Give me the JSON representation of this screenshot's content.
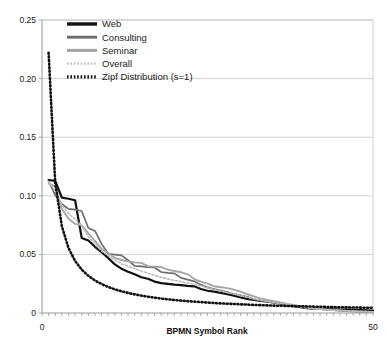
{
  "chart_data": {
    "type": "line",
    "title": "",
    "xlabel": "BPMN Symbol Rank",
    "ylabel": "",
    "xlim": [
      0,
      50
    ],
    "ylim": [
      0,
      0.25
    ],
    "grid": true,
    "legend_position": "top-left-inside",
    "x_tick_labels": [
      "0",
      "50"
    ],
    "x_tick_values": [
      0,
      50
    ],
    "x_minor_tick_count": 50,
    "y_tick_labels": [
      "0",
      "0.05",
      "0.10",
      "0.15",
      "0.20",
      "0.25"
    ],
    "y_tick_values": [
      0,
      0.05,
      0.1,
      0.15,
      0.2,
      0.25
    ],
    "x": [
      1,
      2,
      3,
      4,
      5,
      6,
      7,
      8,
      9,
      10,
      11,
      12,
      13,
      14,
      15,
      16,
      17,
      18,
      19,
      20,
      21,
      22,
      23,
      24,
      25,
      26,
      27,
      28,
      29,
      30,
      31,
      32,
      33,
      34,
      35,
      36,
      37,
      38,
      39,
      40,
      41,
      42,
      43,
      44,
      45,
      46,
      47,
      48,
      49,
      50
    ],
    "series": [
      {
        "name": "Web",
        "color": "#111111",
        "width": 2.2,
        "dash": "none",
        "values": [
          0.1135,
          0.1128,
          0.0985,
          0.0975,
          0.0962,
          0.064,
          0.0618,
          0.0565,
          0.052,
          0.047,
          0.0415,
          0.0378,
          0.0352,
          0.033,
          0.0305,
          0.0292,
          0.0268,
          0.0255,
          0.0248,
          0.0242,
          0.0238,
          0.0232,
          0.0228,
          0.0205,
          0.019,
          0.0182,
          0.0172,
          0.016,
          0.0148,
          0.0132,
          0.012,
          0.0112,
          0.0104,
          0.0098,
          0.009,
          0.0082,
          0.007,
          0.006,
          0.005,
          0.0042,
          0.0038,
          0.0036,
          0.0034,
          0.0032,
          0.003,
          0.0028,
          0.0026,
          0.0024,
          0.0022,
          0.002
        ]
      },
      {
        "name": "Consulting",
        "color": "#6e6e6e",
        "width": 1.7,
        "dash": "none",
        "values": [
          0.1125,
          0.1005,
          0.093,
          0.0888,
          0.0882,
          0.087,
          0.0725,
          0.07,
          0.059,
          0.0505,
          0.0498,
          0.0492,
          0.045,
          0.0402,
          0.0398,
          0.0392,
          0.0388,
          0.035,
          0.0342,
          0.0338,
          0.03,
          0.0285,
          0.027,
          0.0242,
          0.0218,
          0.0205,
          0.0192,
          0.0178,
          0.0162,
          0.015,
          0.0138,
          0.0118,
          0.0105,
          0.0095,
          0.0088,
          0.008,
          0.0072,
          0.0062,
          0.0052,
          0.0045,
          0.0038,
          0.0032,
          0.0028,
          0.0024,
          0.002,
          0.0016,
          0.0013,
          0.0011,
          0.001,
          0.0008
        ]
      },
      {
        "name": "Seminar",
        "color": "#a6a6a6",
        "width": 1.9,
        "dash": "none",
        "values": [
          0.1105,
          0.108,
          0.089,
          0.0805,
          0.076,
          0.0748,
          0.068,
          0.0615,
          0.0548,
          0.0512,
          0.047,
          0.0452,
          0.044,
          0.0432,
          0.0428,
          0.04,
          0.0396,
          0.0392,
          0.037,
          0.0358,
          0.0348,
          0.033,
          0.029,
          0.0268,
          0.025,
          0.0228,
          0.022,
          0.0212,
          0.02,
          0.0182,
          0.016,
          0.0142,
          0.0125,
          0.0112,
          0.01,
          0.009,
          0.0078,
          0.0068,
          0.0058,
          0.0048,
          0.004,
          0.0034,
          0.003,
          0.0026,
          0.0022,
          0.0018,
          0.0015,
          0.0013,
          0.0011,
          0.0009
        ]
      },
      {
        "name": "Overall",
        "color": "#bdbdbd",
        "width": 1.6,
        "dash": "2,2",
        "values": [
          0.112,
          0.1042,
          0.092,
          0.085,
          0.08,
          0.0745,
          0.065,
          0.0588,
          0.053,
          0.049,
          0.0452,
          0.042,
          0.0398,
          0.0378,
          0.0358,
          0.034,
          0.0322,
          0.0305,
          0.029,
          0.0278,
          0.0268,
          0.0255,
          0.0245,
          0.0232,
          0.0215,
          0.02,
          0.0188,
          0.0175,
          0.0162,
          0.0148,
          0.0135,
          0.0122,
          0.011,
          0.01,
          0.009,
          0.0082,
          0.0072,
          0.0062,
          0.0053,
          0.0045,
          0.0038,
          0.0033,
          0.0029,
          0.0025,
          0.0022,
          0.0019,
          0.0016,
          0.0014,
          0.0012,
          0.001
        ]
      },
      {
        "name": "Zipf Distribution (s=1)",
        "color": "#111111",
        "width": 2.6,
        "dash": "1,2.6",
        "values": [
          0.222,
          0.111,
          0.074,
          0.0555,
          0.0444,
          0.037,
          0.0317,
          0.0278,
          0.0247,
          0.0222,
          0.0202,
          0.0185,
          0.0171,
          0.0159,
          0.0148,
          0.0139,
          0.0131,
          0.0123,
          0.0117,
          0.0111,
          0.0106,
          0.0101,
          0.0097,
          0.0093,
          0.0089,
          0.0085,
          0.0082,
          0.0079,
          0.0077,
          0.0074,
          0.0072,
          0.0069,
          0.0067,
          0.0065,
          0.0063,
          0.0062,
          0.006,
          0.0058,
          0.0057,
          0.0056,
          0.0054,
          0.0053,
          0.0052,
          0.005,
          0.0049,
          0.0048,
          0.0047,
          0.0046,
          0.0045,
          0.0044
        ]
      }
    ],
    "legend_entries": [
      {
        "label": "Web",
        "color": "#111111",
        "style": "solid-thick"
      },
      {
        "label": "Consulting",
        "color": "#6e6e6e",
        "style": "solid-medium"
      },
      {
        "label": "Seminar",
        "color": "#a6a6a6",
        "style": "solid-medium"
      },
      {
        "label": "Overall",
        "color": "#bdbdbd",
        "style": "dotted-thin"
      },
      {
        "label": "Zipf Distribution (s=1)",
        "color": "#111111",
        "style": "dotted-thick"
      }
    ]
  }
}
